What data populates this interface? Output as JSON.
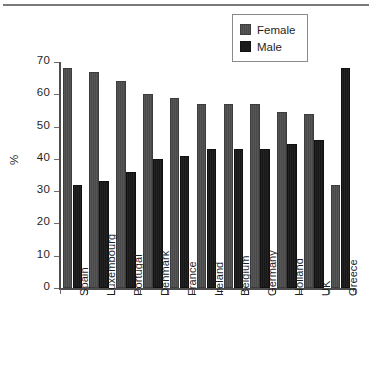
{
  "chart_data": {
    "type": "bar",
    "title": "",
    "subtitle": "",
    "xlabel": "",
    "ylabel": "%",
    "ylim": [
      0,
      70
    ],
    "ytick_step": 10,
    "yticks": [
      0,
      10,
      20,
      30,
      40,
      50,
      60,
      70
    ],
    "ytick_labels": [
      "0",
      "10",
      "20",
      "30",
      "40",
      "50",
      "60",
      "70"
    ],
    "grid": false,
    "legend_position": "top-right",
    "categories": [
      "Spain",
      "Luxembourg",
      "Portugal",
      "Denmark",
      "France",
      "Ireland",
      "Belgium",
      "Germany",
      "Holland",
      "UK",
      "Greece"
    ],
    "series": [
      {
        "name": "Female",
        "color": "#4a4a4a",
        "values": [
          68,
          67,
          64,
          60,
          59,
          57,
          57,
          57,
          54.5,
          54,
          32
        ]
      },
      {
        "name": "Male",
        "color": "#1a1a1a",
        "values": [
          32,
          33,
          36,
          40,
          41,
          43,
          43,
          43,
          44.7,
          45.8,
          68
        ]
      }
    ]
  },
  "legend": {
    "items": [
      {
        "label": "Female",
        "swatch": "female-swatch"
      },
      {
        "label": "Male",
        "swatch": "male-swatch"
      }
    ]
  },
  "axes": {
    "y_title": "%"
  }
}
